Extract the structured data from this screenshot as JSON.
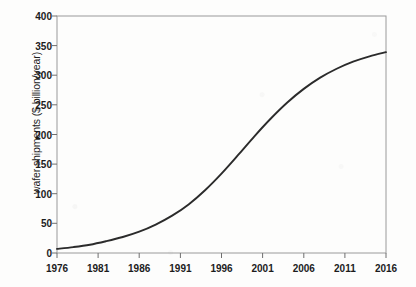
{
  "chart_data": {
    "type": "line",
    "title": "",
    "xlabel": "",
    "ylabel": "wafer shipments ($ billion/year)",
    "xlim": [
      1976,
      2016
    ],
    "ylim": [
      0,
      400
    ],
    "grid": false,
    "legend": "none",
    "xticks": [
      1976,
      1981,
      1986,
      1991,
      1996,
      2001,
      2006,
      2011,
      2016
    ],
    "yticks": [
      0,
      50,
      100,
      150,
      200,
      250,
      300,
      350,
      400
    ],
    "series": [
      {
        "name": "wafer shipments",
        "color": "#2b2b2b",
        "x": [
          1976,
          1978,
          1980,
          1982,
          1984,
          1986,
          1988,
          1990,
          1992,
          1994,
          1996,
          1998,
          2000,
          2002,
          2004,
          2006,
          2008,
          2010,
          2012,
          2014,
          2016
        ],
        "values": [
          7,
          10,
          14,
          20,
          27,
          36,
          48,
          63,
          82,
          106,
          134,
          165,
          197,
          227,
          254,
          277,
          296,
          311,
          323,
          332,
          339
        ]
      }
    ]
  }
}
